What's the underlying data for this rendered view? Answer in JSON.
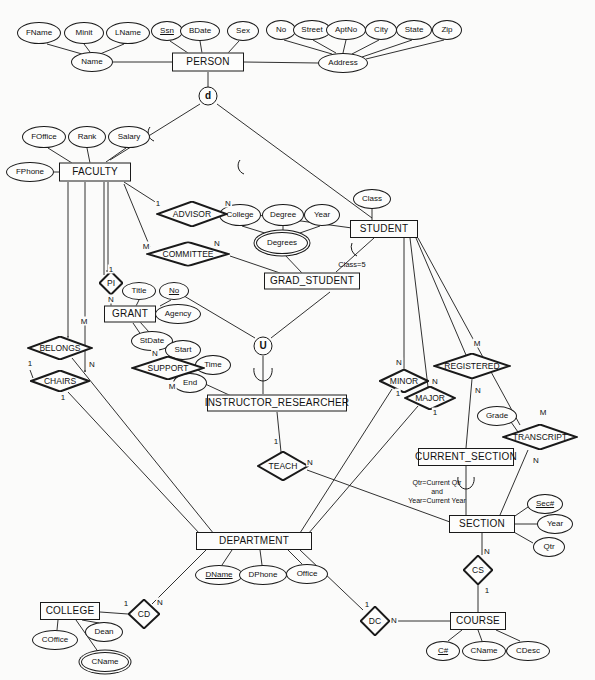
{
  "diagram": {
    "type": "entity-relationship-diagram",
    "stroke_color": "#1a1a1a",
    "background_color": "#fbfbfa"
  },
  "entities": [
    {
      "id": "person",
      "label": "PERSON",
      "x": 208,
      "y": 62,
      "w": 72,
      "h": 19,
      "weak": false
    },
    {
      "id": "faculty",
      "label": "FACULTY",
      "x": 95,
      "y": 172,
      "w": 72,
      "h": 19,
      "weak": false
    },
    {
      "id": "student",
      "label": "STUDENT",
      "x": 384,
      "y": 229,
      "w": 68,
      "h": 18,
      "weak": false
    },
    {
      "id": "grad",
      "label": "GRAD_STUDENT",
      "x": 312,
      "y": 281,
      "w": 96,
      "h": 17,
      "weak": false
    },
    {
      "id": "grant",
      "label": "GRANT",
      "x": 130,
      "y": 314,
      "w": 52,
      "h": 17,
      "weak": false
    },
    {
      "id": "instres",
      "label": "INSTRUCTOR_RESEARCHER",
      "x": 277,
      "y": 403,
      "w": 140,
      "h": 17,
      "weak": false
    },
    {
      "id": "cursection",
      "label": "CURRENT_SECTION",
      "x": 466,
      "y": 457,
      "w": 96,
      "h": 18,
      "weak": false
    },
    {
      "id": "department",
      "label": "DEPARTMENT",
      "x": 254,
      "y": 541,
      "w": 116,
      "h": 18,
      "weak": false
    },
    {
      "id": "section",
      "label": "SECTION",
      "x": 482,
      "y": 524,
      "w": 66,
      "h": 18,
      "weak": false
    },
    {
      "id": "college",
      "label": "COLLEGE",
      "x": 70,
      "y": 611,
      "w": 60,
      "h": 18,
      "weak": false
    },
    {
      "id": "course",
      "label": "COURSE",
      "x": 478,
      "y": 621,
      "w": 56,
      "h": 18,
      "weak": false
    }
  ],
  "attributes": [
    {
      "id": "fname",
      "label": "FName",
      "x": 39,
      "y": 33,
      "rx": 22,
      "ry": 11,
      "key": false,
      "multi": false
    },
    {
      "id": "minit",
      "label": "Minit",
      "x": 84,
      "y": 33,
      "rx": 20,
      "ry": 11,
      "key": false,
      "multi": false
    },
    {
      "id": "lname",
      "label": "LName",
      "x": 128,
      "y": 33,
      "rx": 22,
      "ry": 11,
      "key": false,
      "multi": false
    },
    {
      "id": "ssn",
      "label": "Ssn",
      "x": 167,
      "y": 31,
      "rx": 16,
      "ry": 10,
      "key": true,
      "multi": false
    },
    {
      "id": "bdate",
      "label": "BDate",
      "x": 200,
      "y": 31,
      "rx": 20,
      "ry": 10,
      "key": false,
      "multi": false
    },
    {
      "id": "sex",
      "label": "Sex",
      "x": 243,
      "y": 31,
      "rx": 16,
      "ry": 10,
      "key": false,
      "multi": false
    },
    {
      "id": "name",
      "label": "Name",
      "x": 92,
      "y": 62,
      "rx": 21,
      "ry": 10,
      "key": false,
      "multi": false
    },
    {
      "id": "no",
      "label": "No",
      "x": 281,
      "y": 30,
      "rx": 15,
      "ry": 10,
      "key": false,
      "multi": false
    },
    {
      "id": "street",
      "label": "Street",
      "x": 312,
      "y": 30,
      "rx": 19,
      "ry": 10,
      "key": false,
      "multi": false
    },
    {
      "id": "aptno",
      "label": "AptNo",
      "x": 346,
      "y": 30,
      "rx": 20,
      "ry": 10,
      "key": false,
      "multi": false
    },
    {
      "id": "city",
      "label": "City",
      "x": 381,
      "y": 30,
      "rx": 16,
      "ry": 10,
      "key": false,
      "multi": false
    },
    {
      "id": "state",
      "label": "State",
      "x": 414,
      "y": 30,
      "rx": 18,
      "ry": 10,
      "key": false,
      "multi": false
    },
    {
      "id": "zip",
      "label": "Zip",
      "x": 447,
      "y": 30,
      "rx": 15,
      "ry": 10,
      "key": false,
      "multi": false
    },
    {
      "id": "address",
      "label": "Address",
      "x": 343,
      "y": 63,
      "rx": 25,
      "ry": 10,
      "key": false,
      "multi": false
    },
    {
      "id": "foffice",
      "label": "FOffice",
      "x": 44,
      "y": 137,
      "rx": 22,
      "ry": 11,
      "key": false,
      "multi": false
    },
    {
      "id": "rank",
      "label": "Rank",
      "x": 87,
      "y": 137,
      "rx": 19,
      "ry": 11,
      "key": false,
      "multi": false
    },
    {
      "id": "salary",
      "label": "Salary",
      "x": 129,
      "y": 137,
      "rx": 21,
      "ry": 11,
      "key": false,
      "multi": false
    },
    {
      "id": "fphone",
      "label": "FPhone",
      "x": 30,
      "y": 172,
      "rx": 24,
      "ry": 10,
      "key": false,
      "multi": false
    },
    {
      "id": "college_a",
      "label": "College",
      "x": 240,
      "y": 215,
      "rx": 21,
      "ry": 11,
      "key": false,
      "multi": false
    },
    {
      "id": "degree",
      "label": "Degree",
      "x": 283,
      "y": 215,
      "rx": 21,
      "ry": 11,
      "key": false,
      "multi": false
    },
    {
      "id": "year_a",
      "label": "Year",
      "x": 322,
      "y": 215,
      "rx": 18,
      "ry": 11,
      "key": false,
      "multi": false
    },
    {
      "id": "degrees",
      "label": "Degrees",
      "x": 282,
      "y": 243,
      "rx": 26,
      "ry": 11,
      "key": false,
      "multi": true
    },
    {
      "id": "class",
      "label": "Class",
      "x": 372,
      "y": 199,
      "rx": 19,
      "ry": 10,
      "key": false,
      "multi": false
    },
    {
      "id": "title",
      "label": "Title",
      "x": 139,
      "y": 291,
      "rx": 17,
      "ry": 9,
      "key": false,
      "multi": false
    },
    {
      "id": "gno",
      "label": "No",
      "x": 174,
      "y": 291,
      "rx": 15,
      "ry": 9,
      "key": true,
      "multi": false
    },
    {
      "id": "agency",
      "label": "Agency",
      "x": 178,
      "y": 314,
      "rx": 23,
      "ry": 10,
      "key": false,
      "multi": false
    },
    {
      "id": "stdate",
      "label": "StDate",
      "x": 152,
      "y": 341,
      "rx": 21,
      "ry": 10,
      "key": false,
      "multi": false
    },
    {
      "id": "start",
      "label": "Start",
      "x": 183,
      "y": 350,
      "rx": 18,
      "ry": 10,
      "key": false,
      "multi": false
    },
    {
      "id": "time",
      "label": "Time",
      "x": 213,
      "y": 365,
      "rx": 18,
      "ry": 10,
      "key": false,
      "multi": false
    },
    {
      "id": "end",
      "label": "End",
      "x": 190,
      "y": 383,
      "rx": 17,
      "ry": 10,
      "key": false,
      "multi": false
    },
    {
      "id": "grade",
      "label": "Grade",
      "x": 497,
      "y": 416,
      "rx": 20,
      "ry": 10,
      "key": false,
      "multi": false
    },
    {
      "id": "secno",
      "label": "Sec#",
      "x": 545,
      "y": 504,
      "rx": 18,
      "ry": 10,
      "key": true,
      "multi": false
    },
    {
      "id": "year_s",
      "label": "Year",
      "x": 555,
      "y": 524,
      "rx": 18,
      "ry": 10,
      "key": false,
      "multi": false
    },
    {
      "id": "qtr",
      "label": "Qtr",
      "x": 549,
      "y": 547,
      "rx": 16,
      "ry": 10,
      "key": false,
      "multi": false
    },
    {
      "id": "dname",
      "label": "DName",
      "x": 219,
      "y": 575,
      "rx": 24,
      "ry": 10,
      "key": true,
      "multi": false
    },
    {
      "id": "dphone",
      "label": "DPhone",
      "x": 263,
      "y": 575,
      "rx": 24,
      "ry": 10,
      "key": false,
      "multi": false
    },
    {
      "id": "office",
      "label": "Office",
      "x": 307,
      "y": 574,
      "rx": 21,
      "ry": 10,
      "key": false,
      "multi": false
    },
    {
      "id": "coffice",
      "label": "COffice",
      "x": 55,
      "y": 640,
      "rx": 23,
      "ry": 10,
      "key": false,
      "multi": false
    },
    {
      "id": "dean",
      "label": "Dean",
      "x": 104,
      "y": 632,
      "rx": 19,
      "ry": 10,
      "key": false,
      "multi": false
    },
    {
      "id": "cname_c",
      "label": "CName",
      "x": 105,
      "y": 662,
      "rx": 24,
      "ry": 10,
      "key": false,
      "multi": true
    },
    {
      "id": "cnum",
      "label": "C#",
      "x": 443,
      "y": 651,
      "rx": 17,
      "ry": 10,
      "key": true,
      "multi": false
    },
    {
      "id": "cname",
      "label": "CName",
      "x": 484,
      "y": 651,
      "rx": 22,
      "ry": 10,
      "key": false,
      "multi": false
    },
    {
      "id": "cdesc",
      "label": "CDesc",
      "x": 528,
      "y": 651,
      "rx": 22,
      "ry": 10,
      "key": false,
      "multi": false
    }
  ],
  "relationships": [
    {
      "id": "advisor",
      "label": "ADVISOR",
      "x": 192,
      "y": 214,
      "w": 72,
      "h": 26
    },
    {
      "id": "committee",
      "label": "COMMITTEE",
      "x": 188,
      "y": 254,
      "w": 84,
      "h": 25
    },
    {
      "id": "pi",
      "label": "PI",
      "x": 111,
      "y": 283,
      "w": 24,
      "h": 24
    },
    {
      "id": "belongs",
      "label": "BELONGS",
      "x": 60,
      "y": 348,
      "w": 66,
      "h": 24
    },
    {
      "id": "support",
      "label": "SUPPORT",
      "x": 168,
      "y": 368,
      "w": 74,
      "h": 24
    },
    {
      "id": "chairs",
      "label": "CHAIRS",
      "x": 60,
      "y": 381,
      "w": 60,
      "h": 22
    },
    {
      "id": "teach",
      "label": "TEACH",
      "x": 283,
      "y": 466,
      "w": 52,
      "h": 30
    },
    {
      "id": "minor",
      "label": "MINOR",
      "x": 404,
      "y": 381,
      "w": 50,
      "h": 24
    },
    {
      "id": "major",
      "label": "MAJOR",
      "x": 430,
      "y": 398,
      "w": 52,
      "h": 24
    },
    {
      "id": "registered",
      "label": "REGISTERED",
      "x": 472,
      "y": 366,
      "w": 78,
      "h": 26
    },
    {
      "id": "transcript",
      "label": "TRANSCRIPT",
      "x": 540,
      "y": 437,
      "w": 76,
      "h": 26
    },
    {
      "id": "cs",
      "label": "CS",
      "x": 478,
      "y": 570,
      "w": 30,
      "h": 30
    },
    {
      "id": "cd",
      "label": "CD",
      "x": 144,
      "y": 614,
      "w": 32,
      "h": 30
    },
    {
      "id": "dc",
      "label": "DC",
      "x": 375,
      "y": 621,
      "w": 30,
      "h": 30
    }
  ],
  "specializations": [
    {
      "id": "disjoint-person",
      "label": "d",
      "x": 208,
      "y": 96
    },
    {
      "id": "union-instres",
      "label": "U",
      "x": 263,
      "y": 346
    }
  ],
  "cardinalities": [
    {
      "id": "advisor-1",
      "label": "1",
      "x": 158,
      "y": 203
    },
    {
      "id": "advisor-n",
      "label": "N",
      "x": 228,
      "y": 203
    },
    {
      "id": "committee-m",
      "label": "M",
      "x": 146,
      "y": 246
    },
    {
      "id": "committee-n",
      "label": "N",
      "x": 217,
      "y": 243
    },
    {
      "id": "pi-1",
      "label": "1",
      "x": 111,
      "y": 269
    },
    {
      "id": "pi-n",
      "label": "N",
      "x": 111,
      "y": 299
    },
    {
      "id": "belongs-m",
      "label": "M",
      "x": 84,
      "y": 321
    },
    {
      "id": "belongs-n",
      "label": "N",
      "x": 92,
      "y": 364
    },
    {
      "id": "support-n",
      "label": "N",
      "x": 155,
      "y": 353
    },
    {
      "id": "support-m",
      "label": "M",
      "x": 172,
      "y": 386
    },
    {
      "id": "chairs-1a",
      "label": "1",
      "x": 30,
      "y": 363
    },
    {
      "id": "chairs-1b",
      "label": "1",
      "x": 63,
      "y": 397
    },
    {
      "id": "teach-1",
      "label": "1",
      "x": 276,
      "y": 441
    },
    {
      "id": "teach-n",
      "label": "N",
      "x": 310,
      "y": 462
    },
    {
      "id": "minor-n",
      "label": "N",
      "x": 399,
      "y": 362
    },
    {
      "id": "minor-1",
      "label": "1",
      "x": 398,
      "y": 393
    },
    {
      "id": "major-n",
      "label": "N",
      "x": 435,
      "y": 381
    },
    {
      "id": "major-1",
      "label": "1",
      "x": 435,
      "y": 412
    },
    {
      "id": "registered-m",
      "label": "M",
      "x": 477,
      "y": 343
    },
    {
      "id": "registered-n",
      "label": "N",
      "x": 478,
      "y": 390
    },
    {
      "id": "transcript-m",
      "label": "M",
      "x": 543,
      "y": 412
    },
    {
      "id": "transcript-n",
      "label": "N",
      "x": 536,
      "y": 460
    },
    {
      "id": "cs-n",
      "label": "N",
      "x": 487,
      "y": 551
    },
    {
      "id": "cs-1",
      "label": "1",
      "x": 487,
      "y": 590
    },
    {
      "id": "cd-1",
      "label": "1",
      "x": 126,
      "y": 603
    },
    {
      "id": "cd-n",
      "label": "N",
      "x": 160,
      "y": 602
    },
    {
      "id": "dc-1",
      "label": "1",
      "x": 367,
      "y": 604
    },
    {
      "id": "dc-n",
      "label": "N",
      "x": 394,
      "y": 620
    }
  ],
  "tags": [
    {
      "id": "class5-tag",
      "label": "Class=5",
      "x": 352,
      "y": 264
    }
  ],
  "notes": [
    {
      "id": "current-section-note",
      "label": "Qtr=Current Qtr\nand\nYear=Current Year",
      "x": 437,
      "y": 492
    }
  ]
}
